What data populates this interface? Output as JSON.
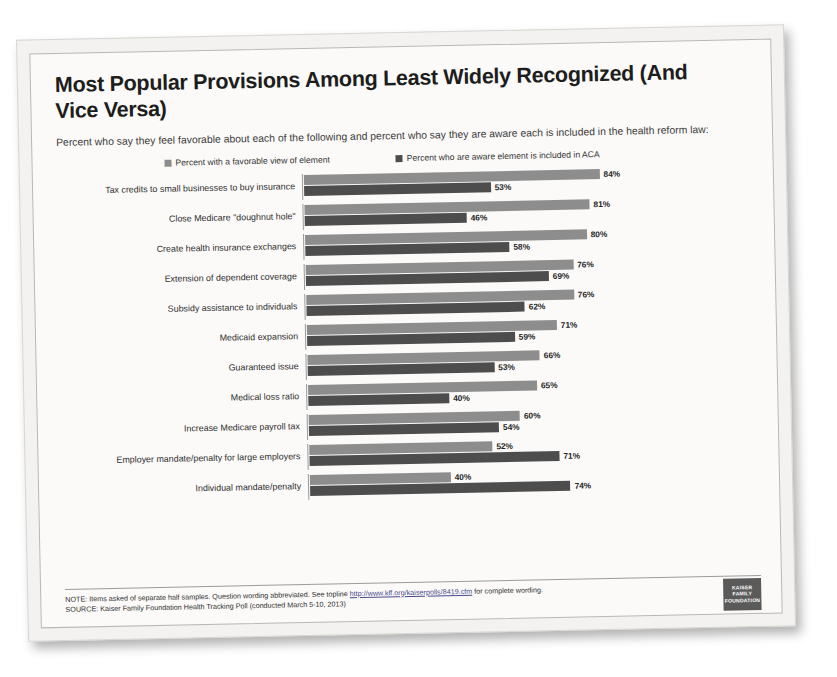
{
  "title": "Most Popular Provisions Among Least Widely Recognized (And Vice Versa)",
  "subtitle": "Percent who say they feel favorable about each of the following and percent who say they are aware each is included in the health reform law:",
  "legend": {
    "favorable": "Percent with a favorable view of element",
    "aware": "Percent who are aware element is included in ACA"
  },
  "colors": {
    "favorable": "#8d8d8d",
    "aware": "#4d4d4d",
    "page": "#fbfaf8",
    "text": "#1d1d1d"
  },
  "footer": {
    "note_before_link": "NOTE: Items asked of separate half samples. Question wording abbreviated. See topline",
    "note_link": "http://www.kff.org/kaiserpolls/8419.cfm",
    "note_after_link": "for complete wording.",
    "source": "SOURCE: Kaiser Family Foundation Health Tracking Poll (conducted March 5-10, 2013)"
  },
  "logo": {
    "line1": "KAISER",
    "line2": "FAMILY",
    "line3": "FOUNDATION"
  },
  "chart_data": {
    "type": "bar",
    "orientation": "horizontal",
    "title": "Most Popular Provisions Among Least Widely Recognized (And Vice Versa)",
    "xlabel": "",
    "ylabel": "",
    "xlim": [
      0,
      100
    ],
    "grid": false,
    "legend_position": "top",
    "value_suffix": "%",
    "categories": [
      "Tax credits to small businesses to buy insurance",
      "Close Medicare \"doughnut hole\"",
      "Create health insurance exchanges",
      "Extension of dependent coverage",
      "Subsidy assistance to individuals",
      "Medicaid expansion",
      "Guaranteed issue",
      "Medical loss ratio",
      "Increase Medicare payroll tax",
      "Employer mandate/penalty for large employers",
      "Individual mandate/penalty"
    ],
    "series": [
      {
        "name": "Percent with a favorable view of element",
        "color": "#8d8d8d",
        "values": [
          84,
          81,
          80,
          76,
          76,
          71,
          66,
          65,
          60,
          52,
          40
        ]
      },
      {
        "name": "Percent who are aware element is included in ACA",
        "color": "#4d4d4d",
        "values": [
          53,
          46,
          58,
          69,
          62,
          59,
          53,
          40,
          54,
          71,
          74
        ]
      }
    ],
    "rows": [
      {
        "label": "Tax credits to small businesses to buy  insurance",
        "favorable": 84,
        "aware": 53,
        "favorable_label": "84%",
        "aware_label": "53%"
      },
      {
        "label": "Close Medicare \"doughnut hole\"",
        "favorable": 81,
        "aware": 46,
        "favorable_label": "81%",
        "aware_label": "46%"
      },
      {
        "label": "Create health insurance exchanges",
        "favorable": 80,
        "aware": 58,
        "favorable_label": "80%",
        "aware_label": "58%"
      },
      {
        "label": "Extension of dependent coverage",
        "favorable": 76,
        "aware": 69,
        "favorable_label": "76%",
        "aware_label": "69%"
      },
      {
        "label": "Subsidy assistance to individuals",
        "favorable": 76,
        "aware": 62,
        "favorable_label": "76%",
        "aware_label": "62%"
      },
      {
        "label": "Medicaid expansion",
        "favorable": 71,
        "aware": 59,
        "favorable_label": "71%",
        "aware_label": "59%"
      },
      {
        "label": "Guaranteed issue",
        "favorable": 66,
        "aware": 53,
        "favorable_label": "66%",
        "aware_label": "53%"
      },
      {
        "label": "Medical loss ratio",
        "favorable": 65,
        "aware": 40,
        "favorable_label": "65%",
        "aware_label": "40%"
      },
      {
        "label": "Increase Medicare payroll tax",
        "favorable": 60,
        "aware": 54,
        "favorable_label": "60%",
        "aware_label": "54%"
      },
      {
        "label": "Employer mandate/penalty for large employers",
        "favorable": 52,
        "aware": 71,
        "favorable_label": "52%",
        "aware_label": "71%"
      },
      {
        "label": "Individual mandate/penalty",
        "favorable": 40,
        "aware": 74,
        "favorable_label": "40%",
        "aware_label": "74%"
      }
    ]
  }
}
